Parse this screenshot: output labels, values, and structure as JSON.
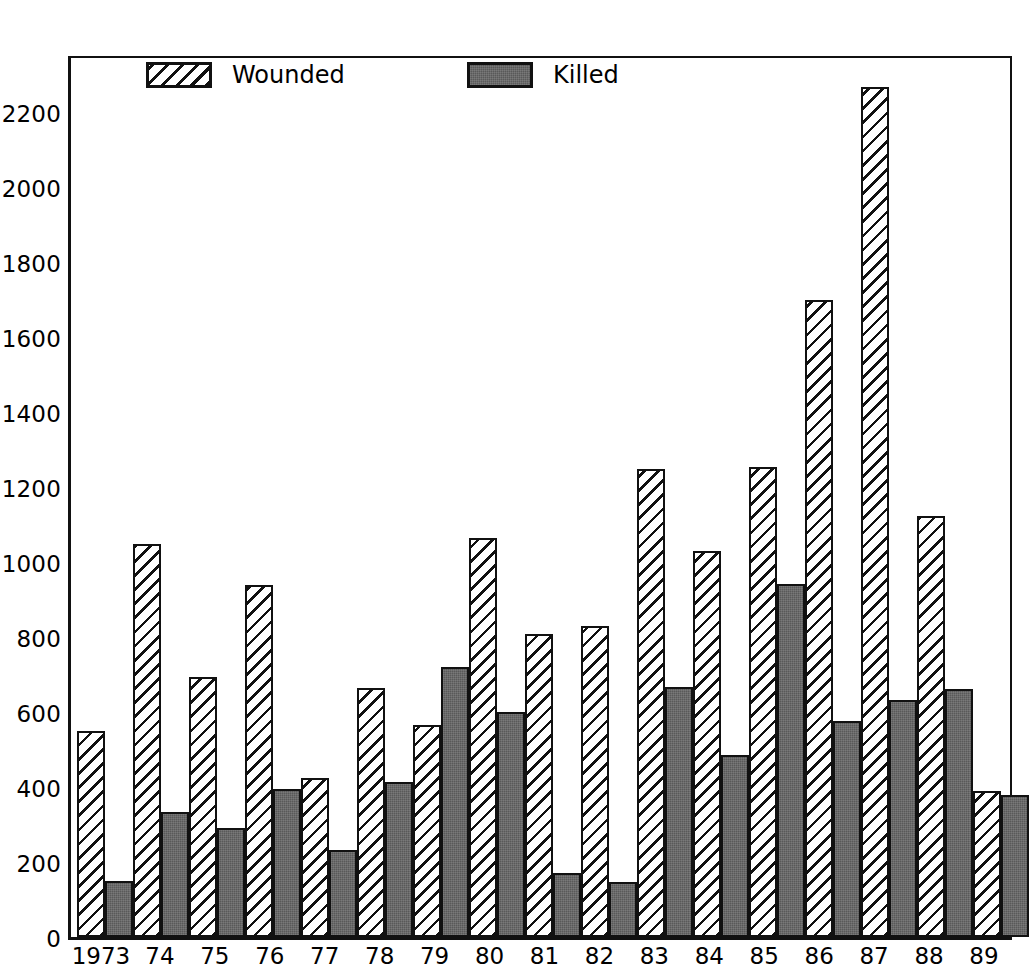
{
  "chart_data": {
    "type": "bar",
    "title": "",
    "subtitle": "",
    "xlabel": "",
    "ylabel": "",
    "ylim": [
      0,
      2360
    ],
    "ytick_step": 200,
    "yticks": [
      0,
      200,
      400,
      600,
      800,
      1000,
      1200,
      1400,
      1600,
      1800,
      2000,
      2200
    ],
    "ytick_labels": [
      "0",
      "200",
      "400",
      "600",
      "800",
      "1000",
      "1200",
      "1400",
      "1600",
      "1800",
      "2000",
      "2200"
    ],
    "grid": false,
    "legend_position": "top-left-inside",
    "categories": [
      "1973",
      "74",
      "75",
      "76",
      "77",
      "78",
      "79",
      "80",
      "81",
      "82",
      "83",
      "84",
      "85",
      "86",
      "87",
      "88",
      "89"
    ],
    "series": [
      {
        "name": "Wounded",
        "fill": "diagonal-hatch",
        "color": "#ffffff",
        "values": [
          550,
          1050,
          695,
          940,
          425,
          665,
          565,
          1065,
          810,
          830,
          1250,
          1030,
          1255,
          1700,
          2270,
          1125,
          390
        ]
      },
      {
        "name": "Killed",
        "fill": "solid-gray",
        "color": "#595959",
        "values": [
          150,
          335,
          290,
          395,
          232,
          413,
          722,
          602,
          170,
          147,
          668,
          487,
          942,
          578,
          632,
          663,
          380
        ]
      }
    ],
    "annotations": []
  },
  "legend": {
    "items": [
      {
        "label": "Wounded",
        "swatch": "hatched-swatch"
      },
      {
        "label": "Killed",
        "swatch": "solid-swatch"
      }
    ]
  },
  "colors": {
    "axis": "#111111",
    "wounded_fill": "#ffffff",
    "wounded_hatch": "#111111",
    "killed_fill": "#595959",
    "background": "#ffffff"
  }
}
